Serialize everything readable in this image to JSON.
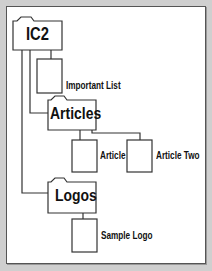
{
  "diagram": {
    "colors": {
      "background": "#cfcfcf",
      "panel": "#ffffff",
      "stroke": "#333333",
      "text": "#111111"
    },
    "root": {
      "label": "IC2",
      "type": "folder"
    },
    "nodes": [
      {
        "id": "important-list",
        "label": "Important List",
        "type": "document",
        "parent": "IC2"
      },
      {
        "id": "articles",
        "label": "Articles",
        "type": "folder",
        "parent": "IC2"
      },
      {
        "id": "article",
        "label": "Article",
        "type": "document",
        "parent": "Articles"
      },
      {
        "id": "article-two",
        "label": "Article Two",
        "type": "document",
        "parent": "Articles"
      },
      {
        "id": "logos",
        "label": "Logos",
        "type": "folder",
        "parent": "IC2"
      },
      {
        "id": "sample-logo",
        "label": "Sample Logo",
        "type": "document",
        "parent": "Logos"
      }
    ]
  }
}
